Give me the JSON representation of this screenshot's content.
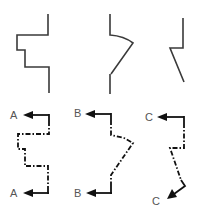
{
  "diagram": {
    "title": "",
    "profiles": [
      {
        "name": "stepped-profile"
      },
      {
        "name": "angled-offset-profile"
      },
      {
        "name": "kinked-profile"
      }
    ],
    "cutting_planes": [
      {
        "name": "section-A",
        "start_label": "A",
        "end_label": "A"
      },
      {
        "name": "section-B",
        "start_label": "B",
        "end_label": "B"
      },
      {
        "name": "section-C",
        "start_label": "C",
        "end_label": "C"
      }
    ],
    "colors": {
      "profile_stroke": "#3a3a3a",
      "cutting_plane_stroke": "#111111",
      "label": "#555555"
    }
  }
}
